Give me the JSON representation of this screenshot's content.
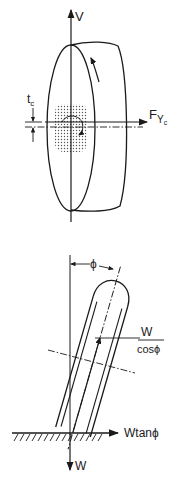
{
  "diagram": {
    "top_figure": {
      "description": "Upright tire with contact patch, vertical and lateral axes",
      "labels": {
        "vertical_axis": "V",
        "lateral_force_main": "F",
        "lateral_force_sub": "Y",
        "lateral_force_subsub": "c",
        "offset_main": "t",
        "offset_sub": "c"
      }
    },
    "bottom_figure": {
      "description": "Cambered tire at angle phi on ground",
      "labels": {
        "camber_angle": "ϕ",
        "normal_force_num": "W",
        "normal_force_den": "cosϕ",
        "lateral_force": "Wtanϕ",
        "weight": "W"
      }
    },
    "colors": {
      "line": "#1a1a1a",
      "background": "#ffffff",
      "patch_dots": "#555555"
    }
  }
}
